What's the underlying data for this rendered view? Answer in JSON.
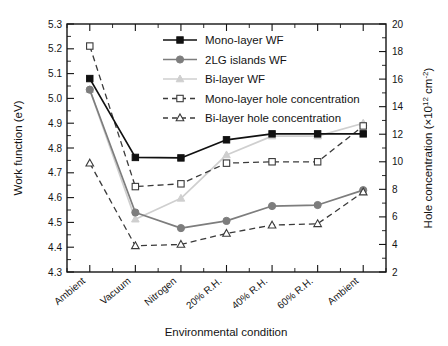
{
  "chart_data": {
    "type": "line",
    "title": "",
    "xlabel": "Environmental condition",
    "ylabel": "Work function (eV)",
    "y2label": "Hole concentration (×10¹² cm⁻²)",
    "categories": [
      "Ambient",
      "Vacuum",
      "Nitrogen",
      "20% R.H.",
      "40% R.H.",
      "60% R.H.",
      "Ambient"
    ],
    "ylim": [
      4.3,
      5.3
    ],
    "y2lim": [
      2,
      20
    ],
    "yticks": [
      "4.3",
      "4.4",
      "4.5",
      "4.6",
      "4.7",
      "4.8",
      "4.9",
      "5.0",
      "5.1",
      "5.2",
      "5.3"
    ],
    "y2ticks": [
      "2",
      "4",
      "6",
      "8",
      "10",
      "12",
      "14",
      "16",
      "18",
      "20"
    ],
    "grid": false,
    "legend_position": "top-center",
    "series": [
      {
        "name": "Mono-layer WF",
        "axis": "left",
        "marker": "square-filled",
        "linestyle": "solid",
        "color": "#111111",
        "values": [
          5.08,
          4.762,
          4.76,
          4.833,
          4.857,
          4.857,
          4.857
        ]
      },
      {
        "name": "2LG islands WF",
        "axis": "left",
        "marker": "circle-filled",
        "linestyle": "solid",
        "color": "#7d7d7d",
        "values": [
          5.035,
          4.54,
          4.477,
          4.506,
          4.566,
          4.57,
          4.63
        ]
      },
      {
        "name": "Bi-layer WF",
        "axis": "left",
        "marker": "triangle-filled",
        "linestyle": "solid",
        "color": "#cfcfcf",
        "values": [
          5.035,
          4.513,
          4.597,
          4.772,
          4.848,
          4.848,
          4.9
        ]
      },
      {
        "name": "Mono-layer hole concentration",
        "axis": "right",
        "marker": "square-open",
        "linestyle": "dashed",
        "color": "#3a3a3a",
        "values": [
          18.4,
          8.2,
          8.4,
          9.9,
          10.0,
          10.0,
          12.6
        ]
      },
      {
        "name": "Bi-layer hole concentration",
        "axis": "right",
        "marker": "triangle-open",
        "linestyle": "dashed",
        "color": "#3a3a3a",
        "values": [
          9.9,
          3.9,
          4.0,
          4.8,
          5.4,
          5.5,
          7.8
        ]
      }
    ]
  },
  "legend": {
    "items": [
      {
        "label": "Mono-layer WF"
      },
      {
        "label": "2LG islands WF"
      },
      {
        "label": "Bi-layer WF"
      },
      {
        "label": "Mono-layer hole concentration"
      },
      {
        "label": "Bi-layer hole concentration"
      }
    ]
  },
  "axes": {
    "left_title": "Work function (eV)",
    "bottom_title": "Environmental condition",
    "right_title_main": "Hole concentration (×10",
    "right_title_sup1": "12",
    "right_title_mid": " cm",
    "right_title_sup2": "-2",
    "right_title_end": ")"
  }
}
